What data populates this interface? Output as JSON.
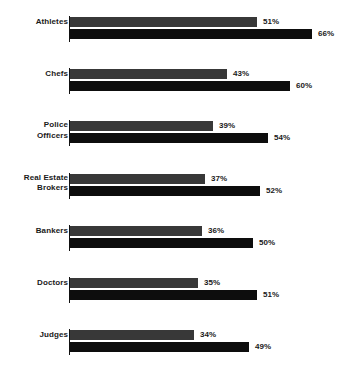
{
  "chart_data": {
    "type": "bar",
    "orientation": "horizontal",
    "title": "",
    "subtitle": "",
    "xlabel": "",
    "ylabel": "",
    "grid": false,
    "legend_position": "none",
    "xlim": [
      0,
      70
    ],
    "value_suffix": "%",
    "categories": [
      "Athletes",
      "Chefs",
      "Police Officers",
      "Real Estate Brokers",
      "Bankers",
      "Doctors",
      "Judges"
    ],
    "series": [
      {
        "name": "Series A",
        "color": "#383838",
        "values": [
          51,
          43,
          39,
          37,
          36,
          35,
          34
        ],
        "labels": [
          "51%",
          "43%",
          "39%",
          "37%",
          "36%",
          "35%",
          "34%"
        ]
      },
      {
        "name": "Series B",
        "color": "#0d0d0d",
        "values": [
          66,
          60,
          54,
          52,
          50,
          51,
          49
        ],
        "labels": [
          "66%",
          "60%",
          "54%",
          "52%",
          "50%",
          "51%",
          "49%"
        ]
      }
    ]
  },
  "groups": [
    {
      "label_line1": "Athletes",
      "label_line2": "",
      "a_label": "51%",
      "b_label": "66%",
      "a_value": 51,
      "b_value": 66
    },
    {
      "label_line1": "Chefs",
      "label_line2": "",
      "a_label": "43%",
      "b_label": "60%",
      "a_value": 43,
      "b_value": 60
    },
    {
      "label_line1": "Police",
      "label_line2": "Officers",
      "a_label": "39%",
      "b_label": "54%",
      "a_value": 39,
      "b_value": 54
    },
    {
      "label_line1": "Real Estate",
      "label_line2": "Brokers",
      "a_label": "37%",
      "b_label": "52%",
      "a_value": 37,
      "b_value": 52
    },
    {
      "label_line1": "Bankers",
      "label_line2": "",
      "a_label": "36%",
      "b_label": "50%",
      "a_value": 36,
      "b_value": 50
    },
    {
      "label_line1": "Doctors",
      "label_line2": "",
      "a_label": "35%",
      "b_label": "51%",
      "a_value": 35,
      "b_value": 51
    },
    {
      "label_line1": "Judges",
      "label_line2": "",
      "a_label": "34%",
      "b_label": "49%",
      "a_value": 34,
      "b_value": 49
    }
  ],
  "style": {
    "series_a_color": "#383838",
    "series_b_color": "#0d0d0d",
    "text_color": "#1a1a1a",
    "background": "#ffffff",
    "axis_color": "#111111"
  },
  "layout": {
    "axis_x": 70,
    "px_per_unit": 3.66,
    "group_top_start": 16,
    "group_pitch": 52.2
  }
}
